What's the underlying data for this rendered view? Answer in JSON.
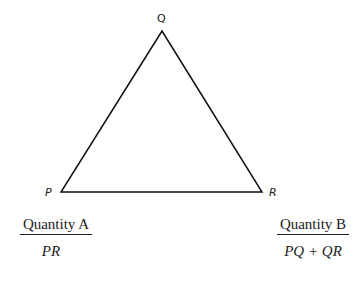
{
  "figure": {
    "shape": "triangle",
    "vertices": {
      "Q": {
        "label": "Q",
        "x": 162,
        "y": 31
      },
      "P": {
        "label": "P",
        "x": 61,
        "y": 192
      },
      "R": {
        "label": "R",
        "x": 262,
        "y": 192
      }
    },
    "stroke_color": "#111111"
  },
  "quantities": {
    "a": {
      "title": "Quantity A",
      "value": "PR"
    },
    "b": {
      "title": "Quantity B",
      "value": "PQ + QR"
    }
  }
}
